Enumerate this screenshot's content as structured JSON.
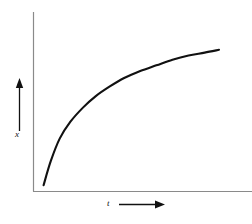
{
  "chart_data": {
    "type": "line",
    "title": "",
    "subtitle": "",
    "xlabel": "t",
    "ylabel": "x",
    "xlabel_arrow": "right-arrow",
    "ylabel_arrow": "up-arrow",
    "grid": false,
    "legend": null,
    "xlim": [
      0,
      1
    ],
    "ylim": [
      0,
      1
    ],
    "x_tick_labels": [],
    "y_tick_labels": [],
    "annotations": [],
    "series": [
      {
        "name": "x(t)",
        "description": "exponential saturation curve rising steeply then flattening toward an asymptote",
        "color": "#111111",
        "x": [
          0.02,
          0.06,
          0.11,
          0.17,
          0.24,
          0.31,
          0.39,
          0.47,
          0.56,
          0.65,
          0.74,
          0.83,
          0.92,
          1.0
        ],
        "y": [
          0.02,
          0.19,
          0.35,
          0.47,
          0.57,
          0.65,
          0.72,
          0.78,
          0.83,
          0.87,
          0.91,
          0.94,
          0.96,
          0.98
        ]
      }
    ]
  },
  "figure": {
    "axes": {
      "y_axis_name": "vertical-axis",
      "x_axis_name": "horizontal-axis",
      "color": "#8a8a8a"
    },
    "curve_color": "#111111",
    "background": "#ffffff"
  },
  "labels": {
    "y": "x",
    "x": "t"
  }
}
